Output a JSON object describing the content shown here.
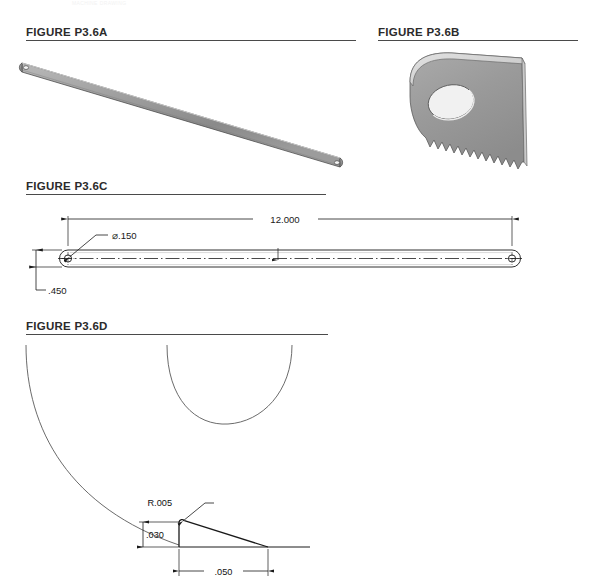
{
  "page": {
    "faint_header": "MACHINE DRAWING",
    "background_color": "#ffffff",
    "width": 597,
    "height": 581
  },
  "style": {
    "blade_fill_dark": "#8e8e8e",
    "blade_fill_light": "#b8b8b8",
    "blade_outline": "#4a4a4a",
    "line_color": "#1a1a1a",
    "rule_color": "#4a4a4a",
    "arc_color": "#555555"
  },
  "figures": [
    {
      "id": "p3-6a",
      "title": "FIGURE P3.6A",
      "caption_rule": true,
      "description": "isometric view of full hacksaw blade with mounting holes at both ends"
    },
    {
      "id": "p3-6b",
      "title": "FIGURE P3.6B",
      "caption_rule": true,
      "description": "enlarged isometric view of blade end showing mounting hole and saw teeth"
    },
    {
      "id": "p3-6c",
      "title": "FIGURE P3.6C",
      "caption_rule": true,
      "description": "dimensioned orthographic front view of blade with centerline",
      "dimensions": [
        {
          "name": "overall-length",
          "label": "12.000"
        },
        {
          "name": "hole-diameter",
          "label": "⌀.150"
        },
        {
          "name": "blade-width",
          "label": ".450"
        }
      ]
    },
    {
      "id": "p3-6d",
      "title": "FIGURE P3.6D",
      "caption_rule": true,
      "description": "detail view of single saw tooth profile with detail bubble arcs",
      "dimensions": [
        {
          "name": "tooth-tip-radius",
          "label": "R.005"
        },
        {
          "name": "tooth-height",
          "label": ".030"
        },
        {
          "name": "tooth-pitch",
          "label": ".050"
        }
      ]
    }
  ]
}
